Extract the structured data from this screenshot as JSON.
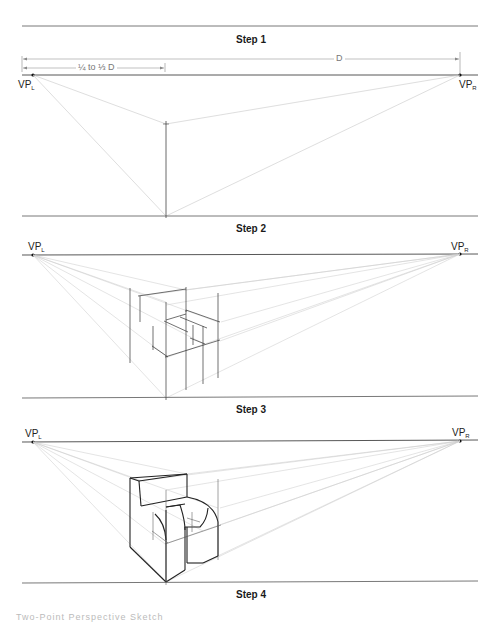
{
  "figure": {
    "steps": [
      {
        "label": "Step 1"
      },
      {
        "label": "Step 2"
      },
      {
        "label": "Step 3"
      },
      {
        "label": "Step 4"
      }
    ],
    "vanishing_points": {
      "left": {
        "base": "VP",
        "sub": "L"
      },
      "right": {
        "base": "VP",
        "sub": "R"
      }
    },
    "dimensions": {
      "full": "D",
      "fraction": "¼ to ⅓ D"
    },
    "caption": "Two-Point Perspective Sketch"
  },
  "colors": {
    "ink": "#222222",
    "construction": "#c8c8c8",
    "dimension": "#888888"
  }
}
